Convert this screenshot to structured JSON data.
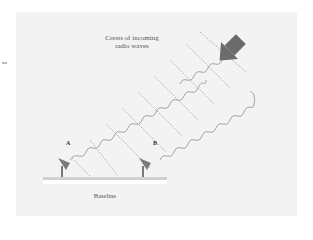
{
  "diagram": {
    "caption_line1": "Crests of incoming",
    "caption_line2": "radio waves",
    "antenna_a_label": "A",
    "antenna_b_label": "B",
    "baseline_label": "Baseline",
    "colors": {
      "panel_bg": "#f3f3f3",
      "arrow": "#6b6b6b",
      "wave": "#9a9a9a",
      "crest_lines": "#8a8a8a",
      "antenna": "#7a7a7a",
      "baseline_bar": "#cfcfcf"
    },
    "icons": [
      "arrow-icon",
      "radio-dish-icon"
    ]
  }
}
